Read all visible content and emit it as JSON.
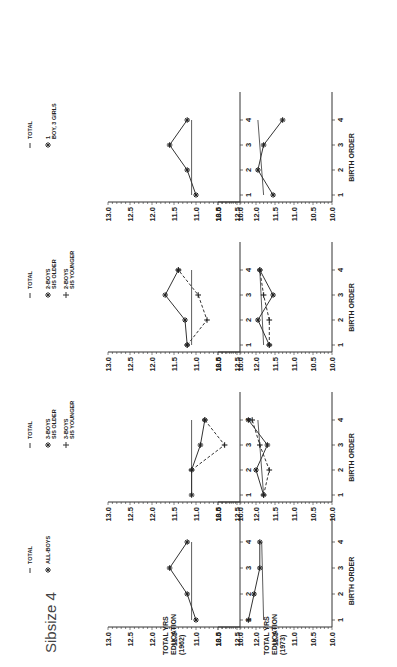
{
  "page": {
    "title": "Sibsize 4",
    "x_axis_label": "BIRTH ORDER",
    "row_labels": [
      [
        "TOTAL YRS",
        "EDUCATION",
        "(1962)"
      ],
      [
        "TOTAL YRS",
        "EDUCATION",
        "(1973)"
      ]
    ],
    "y_ticks": [
      "13.0",
      "12.5",
      "12.0",
      "11.5",
      "11.0",
      "10.5",
      "10.0"
    ],
    "x_ticks": [
      "1",
      "2",
      "3",
      "4"
    ]
  },
  "chart_data": [
    {
      "type": "line",
      "panel": "1962 / All boys",
      "title": "",
      "xlabel": "",
      "ylabel": "TOTAL YRS EDUCATION (1962)",
      "x": [
        1,
        2,
        3,
        4
      ],
      "ylim": [
        10.0,
        13.0
      ],
      "legend": [
        "TOTAL",
        "ALL-BOYS"
      ],
      "series": [
        {
          "name": "TOTAL",
          "style": "solid",
          "marker": "none",
          "values": [
            11.1,
            11.1,
            11.1,
            11.1
          ]
        },
        {
          "name": "ALL-BOYS",
          "style": "solid",
          "marker": "star",
          "values": [
            11.0,
            11.2,
            11.6,
            11.2
          ]
        }
      ]
    },
    {
      "type": "line",
      "panel": "1962 / 3 boys",
      "title": "",
      "xlabel": "",
      "ylabel": "",
      "x": [
        1,
        2,
        3,
        4
      ],
      "ylim": [
        10.0,
        13.0
      ],
      "legend": [
        "TOTAL",
        "3-BOYS SIS OLDER",
        "3-BOYS SIS YOUNGER"
      ],
      "series": [
        {
          "name": "TOTAL",
          "style": "solid",
          "marker": "none",
          "values": [
            11.1,
            11.1,
            11.1,
            11.1
          ]
        },
        {
          "name": "3-BOYS SIS OLDER",
          "style": "solid",
          "marker": "star",
          "values": [
            11.1,
            11.1,
            10.9,
            10.8
          ]
        },
        {
          "name": "3-BOYS SIS YOUNGER",
          "style": "dashed",
          "marker": "plus",
          "values": [
            null,
            11.1,
            10.35,
            10.8
          ]
        }
      ]
    },
    {
      "type": "line",
      "panel": "1962 / 2 boys",
      "title": "",
      "xlabel": "",
      "ylabel": "",
      "x": [
        1,
        2,
        3,
        4
      ],
      "ylim": [
        10.0,
        13.0
      ],
      "legend": [
        "TOTAL",
        "2-BOYS SIS OLDER",
        "2-BOYS SIS YOUNGER"
      ],
      "series": [
        {
          "name": "TOTAL",
          "style": "solid",
          "marker": "none",
          "values": [
            11.1,
            11.1,
            11.1,
            11.1
          ]
        },
        {
          "name": "2-BOYS SIS OLDER",
          "style": "solid",
          "marker": "star",
          "values": [
            11.2,
            11.25,
            11.7,
            11.4
          ]
        },
        {
          "name": "2-BOYS SIS YOUNGER",
          "style": "dashed",
          "marker": "plus",
          "values": [
            11.2,
            10.75,
            10.95,
            11.4
          ]
        }
      ]
    },
    {
      "type": "line",
      "panel": "1962 / 1 boy 3 girls",
      "title": "",
      "xlabel": "",
      "ylabel": "",
      "x": [
        1,
        2,
        3,
        4
      ],
      "ylim": [
        10.0,
        13.0
      ],
      "legend": [
        "TOTAL",
        "1 BOY, 3 GIRLS"
      ],
      "series": [
        {
          "name": "TOTAL",
          "style": "solid",
          "marker": "none",
          "values": [
            11.1,
            11.1,
            11.1,
            11.1
          ]
        },
        {
          "name": "1 BOY, 3 GIRLS",
          "style": "solid",
          "marker": "star",
          "values": [
            11.0,
            11.2,
            11.6,
            11.2
          ]
        }
      ]
    },
    {
      "type": "line",
      "panel": "1973 / All boys",
      "title": "",
      "xlabel": "BIRTH ORDER",
      "ylabel": "TOTAL YRS EDUCATION (1973)",
      "x": [
        1,
        2,
        3,
        4
      ],
      "ylim": [
        10.0,
        13.0
      ],
      "series": [
        {
          "name": "TOTAL",
          "style": "solid",
          "marker": "none",
          "values": [
            11.8,
            11.85,
            11.85,
            11.85
          ]
        },
        {
          "name": "ALL-BOYS",
          "style": "solid",
          "marker": "star",
          "values": [
            12.2,
            12.05,
            11.9,
            11.9
          ]
        }
      ]
    },
    {
      "type": "line",
      "panel": "1973 / 3 boys",
      "title": "",
      "xlabel": "BIRTH ORDER",
      "ylabel": "",
      "x": [
        1,
        2,
        3,
        4
      ],
      "ylim": [
        10.0,
        13.0
      ],
      "series": [
        {
          "name": "TOTAL",
          "style": "solid",
          "marker": "none",
          "values": [
            11.8,
            11.85,
            11.85,
            11.95
          ]
        },
        {
          "name": "3-BOYS SIS OLDER",
          "style": "solid",
          "marker": "star",
          "values": [
            11.8,
            12.0,
            11.7,
            12.2
          ]
        },
        {
          "name": "3-BOYS SIS YOUNGER",
          "style": "dashed",
          "marker": "plus",
          "values": [
            11.8,
            11.65,
            11.9,
            12.1
          ]
        }
      ]
    },
    {
      "type": "line",
      "panel": "1973 / 2 boys",
      "title": "",
      "xlabel": "BIRTH ORDER",
      "ylabel": "",
      "x": [
        1,
        2,
        3,
        4
      ],
      "ylim": [
        10.0,
        13.0
      ],
      "series": [
        {
          "name": "TOTAL",
          "style": "solid",
          "marker": "none",
          "values": [
            11.8,
            11.85,
            11.8,
            11.9
          ]
        },
        {
          "name": "2-BOYS SIS OLDER",
          "style": "solid",
          "marker": "star",
          "values": [
            11.65,
            11.95,
            11.55,
            11.9
          ]
        },
        {
          "name": "2-BOYS SIS YOUNGER",
          "style": "dashed",
          "marker": "plus",
          "values": [
            11.65,
            11.65,
            11.8,
            11.9
          ]
        }
      ]
    },
    {
      "type": "line",
      "panel": "1973 / 1 boy 3 girls",
      "title": "",
      "xlabel": "BIRTH ORDER",
      "ylabel": "",
      "x": [
        1,
        2,
        3,
        4
      ],
      "ylim": [
        10.0,
        13.0
      ],
      "series": [
        {
          "name": "TOTAL",
          "style": "solid",
          "marker": "none",
          "values": [
            11.8,
            11.85,
            11.85,
            11.95
          ]
        },
        {
          "name": "1 BOY, 3 GIRLS",
          "style": "solid",
          "marker": "star",
          "values": [
            11.55,
            11.95,
            11.8,
            11.3
          ]
        }
      ]
    }
  ]
}
